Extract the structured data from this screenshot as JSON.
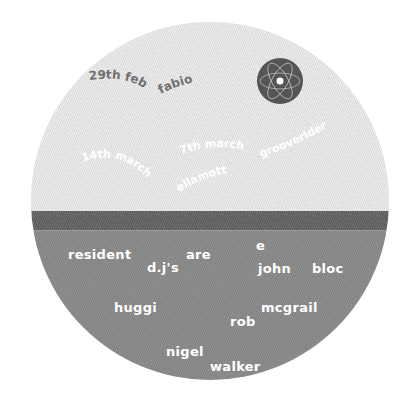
{
  "flyer": {
    "upcoming": {
      "date_1": "29th feb",
      "artist_1": "fabio",
      "date_2": "14th march",
      "date_3": "7th march",
      "artist_2": "ellamott",
      "artist_3": "grooverider"
    },
    "residents": {
      "word_resident": "resident",
      "word_djs": "d.j's",
      "word_are": "are",
      "names": [
        {
          "first": "john",
          "last": "bloc",
          "extra": "e"
        },
        {
          "first": "huggi"
        },
        {
          "first": "rob",
          "last": "mcgrail"
        },
        {
          "first": "nigel",
          "last": "walker"
        }
      ]
    },
    "logo": "atom-sphere-icon"
  },
  "colors": {
    "top_area": "#e3e3e3",
    "band": "#636363",
    "bottom_area": "#888888",
    "dark_text": "#6e6e6e",
    "white_text": "#ffffff"
  }
}
